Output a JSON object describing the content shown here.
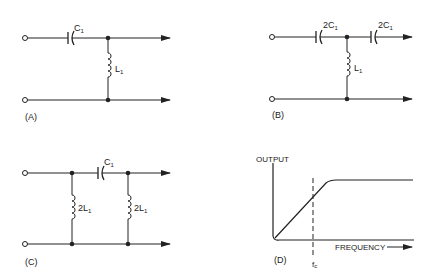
{
  "panels": {
    "A": {
      "label": "(A)",
      "capacitor": "C",
      "capacitor_sub": "1",
      "inductor": "L",
      "inductor_sub": "1"
    },
    "B": {
      "label": "(B)",
      "capacitor1": "2C",
      "capacitor1_sub": "1",
      "capacitor2": "2C",
      "capacitor2_sub": "1",
      "inductor": "L",
      "inductor_sub": "1"
    },
    "C": {
      "label": "(C)",
      "capacitor": "C",
      "capacitor_sub": "1",
      "inductor1": "2L",
      "inductor1_sub": "1",
      "inductor2": "2L",
      "inductor2_sub": "1"
    },
    "D": {
      "label": "(D)",
      "y_axis_label": "OUTPUT",
      "x_axis_label": "FREQUENCY",
      "cutoff_label": "f",
      "cutoff_sub": "c"
    }
  },
  "colors": {
    "ink": "#222222",
    "background": "#ffffff"
  }
}
